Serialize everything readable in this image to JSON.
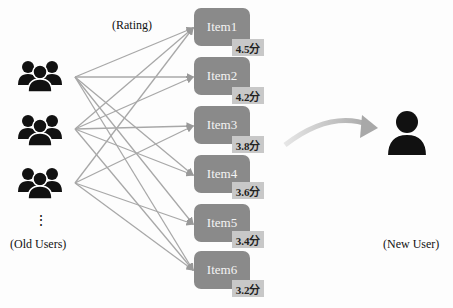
{
  "labels": {
    "rating": "(Rating)",
    "old_users": "(Old Users)",
    "new_user": "(New User)",
    "ellipsis": "⋮"
  },
  "items": [
    {
      "name": "Item1",
      "score": "4.5分"
    },
    {
      "name": "Item2",
      "score": "4.2分"
    },
    {
      "name": "Item3",
      "score": "3.8分"
    },
    {
      "name": "Item4",
      "score": "3.6分"
    },
    {
      "name": "Item5",
      "score": "3.4分"
    },
    {
      "name": "Item6",
      "score": "3.2分"
    }
  ],
  "icons": {
    "old_user_group": "users-group-icon",
    "new_user": "user-icon",
    "arrow": "curved-arrow-icon"
  },
  "colors": {
    "item_bg": "#8a8a8a",
    "badge_bg": "#c8c8c8",
    "line": "#a8a8a8",
    "icon": "#111111"
  }
}
